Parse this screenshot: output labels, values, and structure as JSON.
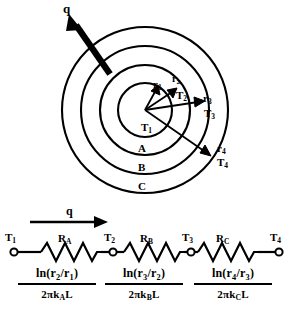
{
  "figure": {
    "ink_color": "#000000",
    "background_color": "#ffffff"
  },
  "cylinder_diagram": {
    "heat_flow_arrow_label": "q",
    "center_temperature_label": "T",
    "center_temperature_sub": "1",
    "radii": [
      {
        "label": "r",
        "sub": "1"
      },
      {
        "label": "r",
        "sub": "2"
      },
      {
        "label": "r",
        "sub": "3"
      },
      {
        "label": "r",
        "sub": "4"
      }
    ],
    "interface_temperatures": [
      {
        "label": "T",
        "sub": "2"
      },
      {
        "label": "T",
        "sub": "3"
      },
      {
        "label": "T",
        "sub": "4"
      }
    ],
    "layers": [
      {
        "name": "A"
      },
      {
        "name": "B"
      },
      {
        "name": "C"
      }
    ]
  },
  "resistance_network": {
    "flow_label": "q",
    "nodes": [
      {
        "label": "T",
        "sub": "1"
      },
      {
        "label": "T",
        "sub": "2"
      },
      {
        "label": "T",
        "sub": "3"
      },
      {
        "label": "T",
        "sub": "4"
      }
    ],
    "resistors": [
      {
        "label": "R",
        "sub": "A",
        "numerator_pre": "ln(r",
        "numerator_sub1": "2",
        "numerator_mid": "/r",
        "numerator_sub2": "1",
        "numerator_post": ")",
        "denominator_pre": "2πk",
        "denominator_sub": "A",
        "denominator_post": "L"
      },
      {
        "label": "R",
        "sub": "B",
        "numerator_pre": "ln(r",
        "numerator_sub1": "3",
        "numerator_mid": "/r",
        "numerator_sub2": "2",
        "numerator_post": ")",
        "denominator_pre": "2πk",
        "denominator_sub": "B",
        "denominator_post": "L"
      },
      {
        "label": "R",
        "sub": "C",
        "numerator_pre": "ln(r",
        "numerator_sub1": "4",
        "numerator_mid": "/r",
        "numerator_sub2": "3",
        "numerator_post": ")",
        "denominator_pre": "2πk",
        "denominator_sub": "C",
        "denominator_post": "L"
      }
    ]
  }
}
